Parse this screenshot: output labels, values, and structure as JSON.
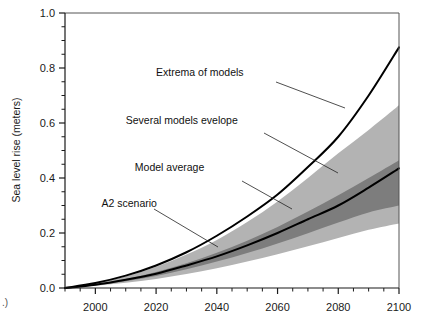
{
  "figure": {
    "background_color": "#ffffff",
    "corner_mark": ".)",
    "left_edge_mark": ")"
  },
  "chart_data": {
    "type": "area",
    "title": "",
    "xlabel": "",
    "ylabel": "Sea level rise (meters)",
    "xlim": [
      1990,
      2100
    ],
    "ylim": [
      0.0,
      1.0
    ],
    "grid": false,
    "legend_position": "inline-annotations",
    "x_ticks": [
      2000,
      2020,
      2040,
      2060,
      2080,
      2100
    ],
    "x_tick_labels": [
      "2000",
      "2020",
      "2040",
      "2060",
      "2080",
      "2100"
    ],
    "x_minor_tick_interval": 5,
    "y_ticks": [
      0.0,
      0.2,
      0.4,
      0.6,
      0.8,
      1.0
    ],
    "y_tick_labels": [
      "0.0",
      "0.2",
      "0.4",
      "0.6",
      "0.8",
      "1.0"
    ],
    "y_minor_tick_interval": 0.05,
    "x": [
      1990,
      2000,
      2010,
      2020,
      2030,
      2040,
      2050,
      2060,
      2070,
      2080,
      2090,
      2100
    ],
    "series": [
      {
        "name": "Extrema of models",
        "kind": "line",
        "color": "#000000",
        "values": [
          0.0,
          0.018,
          0.045,
          0.082,
          0.13,
          0.19,
          0.26,
          0.34,
          0.44,
          0.55,
          0.7,
          0.875
        ]
      },
      {
        "name": "A2 scenario",
        "kind": "line",
        "color": "#000000",
        "values": [
          0.0,
          0.012,
          0.03,
          0.052,
          0.082,
          0.115,
          0.155,
          0.2,
          0.25,
          0.3,
          0.365,
          0.435
        ]
      },
      {
        "name": "Several models evelope",
        "kind": "band",
        "color": "#b3b3b3",
        "upper": [
          0.0,
          0.017,
          0.042,
          0.077,
          0.122,
          0.175,
          0.24,
          0.315,
          0.4,
          0.49,
          0.575,
          0.665
        ],
        "lower": [
          0.0,
          0.008,
          0.019,
          0.033,
          0.051,
          0.072,
          0.096,
          0.123,
          0.152,
          0.182,
          0.212,
          0.235
        ]
      },
      {
        "name": "Model average",
        "kind": "band",
        "color": "#7d7d7d",
        "upper": [
          0.0,
          0.013,
          0.033,
          0.058,
          0.09,
          0.128,
          0.172,
          0.222,
          0.278,
          0.337,
          0.4,
          0.465
        ],
        "lower": [
          0.0,
          0.01,
          0.025,
          0.044,
          0.068,
          0.096,
          0.127,
          0.162,
          0.199,
          0.238,
          0.275,
          0.3
        ]
      }
    ],
    "annotations": [
      {
        "id": "extrema-of-models",
        "text": "Extrema of models",
        "x": 2020,
        "y": 0.77
      },
      {
        "id": "several-models-evelope",
        "text": "Several models evelope",
        "x": 2010,
        "y": 0.595
      },
      {
        "id": "model-average",
        "text": "Model average",
        "x": 2013,
        "y": 0.425
      },
      {
        "id": "a2-scenario",
        "text": "A2 scenario",
        "x": 2002,
        "y": 0.295
      }
    ]
  }
}
